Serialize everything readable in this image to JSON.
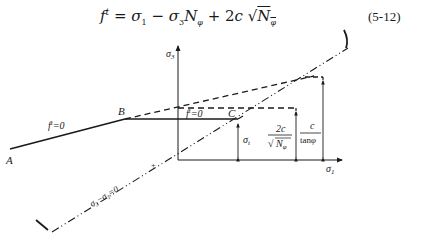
{
  "equation": {
    "lhs": "f",
    "lhs_superscript": "t",
    "equals": "=",
    "terms": [
      "σ₁",
      "−",
      "σ₃N",
      "+",
      "2c",
      "√N"
    ],
    "subscript_phi": "φ",
    "text": "f t = σ1 − σ3 Nφ + 2c √Nφ",
    "number": "(5-12)"
  },
  "diagram": {
    "axes": {
      "vertical": "σ₃",
      "horizontal": "σ₁"
    },
    "points": {
      "A": "A",
      "B": "B",
      "C": "C"
    },
    "labels": {
      "ft_left": "f ᵗ=0",
      "ft_mid": "f ᵗ=0",
      "sigma_t": "σ",
      "sigma_t_sub": "t",
      "frac1_num": "2c",
      "frac1_den": "N",
      "frac1_den_sub": "φ",
      "frac2_num": "c",
      "frac2_den": "tanφ",
      "hydro_line": "σ₃−σ₁=0",
      "origin_mark": "+"
    },
    "colors": {
      "ink": "#1a1a1a",
      "background": "#ffffff"
    }
  }
}
